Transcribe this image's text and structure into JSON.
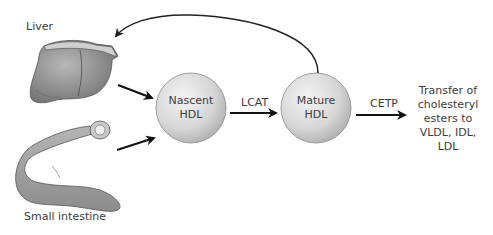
{
  "organs": {
    "liver": {
      "label": "Liver"
    },
    "small_intestine": {
      "label": "Small intestine"
    }
  },
  "nodes": {
    "nascent_hdl": {
      "line1": "Nascent",
      "line2": "HDL"
    },
    "mature_hdl": {
      "line1": "Mature",
      "line2": "HDL"
    }
  },
  "edges": {
    "lcat": {
      "label": "LCAT"
    },
    "cetp": {
      "label": "CETP"
    }
  },
  "outcome": {
    "lines": [
      "Transfer of",
      "cholesteryl",
      "esters to",
      "VLDL, IDL,",
      "LDL"
    ]
  },
  "colors": {
    "node_fill_light": "#f2f2f2",
    "node_fill_dark": "#bdbdbd",
    "organ_fill": "#9a9a9a",
    "arrow": "#111111"
  }
}
